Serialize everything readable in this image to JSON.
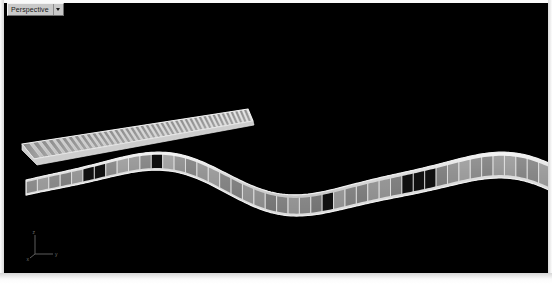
{
  "window": {
    "background_color": "#000000",
    "chrome_color": "#e8e8e8"
  },
  "viewport": {
    "name": "perspective-viewport",
    "label": "Perspective",
    "dropdown_arrow": "chevron-down-icon",
    "shading_mode": "shaded",
    "background": "#000000"
  },
  "axis_gizmo": {
    "name": "axis-tripod",
    "axes": [
      {
        "label": "z",
        "direction": "up"
      },
      {
        "label": "y",
        "direction": "right"
      },
      {
        "label": "x",
        "direction": "lower-left"
      }
    ],
    "color": "#6f6f6f"
  },
  "scene": {
    "objects": [
      {
        "name": "serpentine-band",
        "type": "segmented-ribbon",
        "description": "Sinusoidal horizontal band built from rectangular panels with a light top rail",
        "segment_count": 46,
        "dark_panel_indices": [
          5,
          6,
          11,
          26,
          33,
          34,
          35
        ],
        "face_color": "#9a9a9a",
        "rail_color": "#e6e6e6",
        "dark_panel_color": "#101010"
      },
      {
        "name": "louver-panel",
        "type": "slatted-array",
        "description": "Angled flat frame filled with parallel vertical slats receding in perspective",
        "slat_count": 42,
        "frame_color": "#cfcfcf",
        "slat_color": "#8e8e8e",
        "gap_color": "#d9d9d9"
      }
    ]
  }
}
